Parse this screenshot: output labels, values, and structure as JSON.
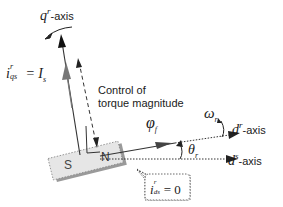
{
  "diagram": {
    "labels": {
      "q_axis": {
        "symbol": "q",
        "superscript": "r",
        "suffix": "-axis"
      },
      "d_axis_rotor": {
        "symbol": "d",
        "superscript": "r",
        "suffix": "-axis"
      },
      "d_axis_stator": {
        "symbol": "d",
        "superscript": "s",
        "suffix": "-axis"
      },
      "iqs_eq": {
        "symbol": "i",
        "superscript": "r",
        "subscript": "qs",
        "equals": "= I",
        "rhs_subscript": "s"
      },
      "ids_eq": {
        "symbol": "i",
        "superscript": "r",
        "subscript": "ds",
        "equals": "= 0"
      },
      "control_text_line1": "Control of",
      "control_text_line2": "torque magnitude",
      "phi_f": {
        "symbol": "φ",
        "subscript": "f"
      },
      "omega_r": {
        "symbol": "ω",
        "subscript": "r"
      },
      "theta_r": {
        "symbol": "θ",
        "subscript": "r"
      }
    },
    "magnet": {
      "south": "S",
      "north": "N"
    },
    "colors": {
      "line": "#333333",
      "arrow_gray": "#777777",
      "magnet_fill": "#e6e6e6",
      "magnet_shadow": "#9a9a9a"
    }
  }
}
